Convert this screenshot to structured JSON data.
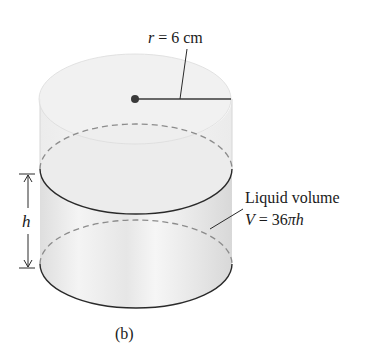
{
  "figure": {
    "subfigure_label": "(b)",
    "radius_label": {
      "variable": "r",
      "equals": " = ",
      "value": "6 cm"
    },
    "height_label": "h",
    "liquid_label": {
      "line1": "Liquid volume",
      "volume_var": "V",
      "volume_eq": " = 36",
      "pi": "π",
      "h": "h"
    }
  },
  "colors": {
    "outline": "#2a2a2a",
    "dashed": "#8c8c8c",
    "fill_light": "#f0f0f0",
    "fill_liquid": "#e2e2e2",
    "dot": "#3a3a3a"
  }
}
